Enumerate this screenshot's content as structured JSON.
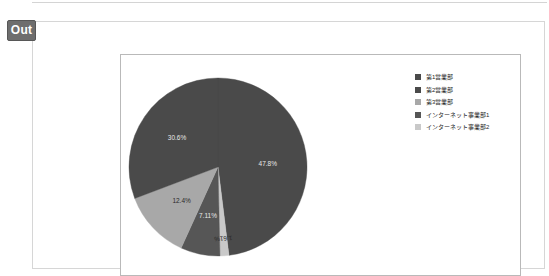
{
  "badge": {
    "label": "Out"
  },
  "chart_data": {
    "type": "pie",
    "title": "",
    "legend_position": "right",
    "categories": [
      "第1営業部",
      "第2営業部",
      "第3営業部",
      "インターネット事業部1",
      "インターネット事業部2"
    ],
    "values": [
      47.8,
      30.6,
      12.4,
      7.11,
      1.61
    ],
    "value_labels": [
      "47.8%",
      "30.6%",
      "12.4%",
      "7.11%",
      "1.61%"
    ],
    "colors": [
      "#4a4a4a",
      "#4a4a4a",
      "#a8a8a8",
      "#565656",
      "#c9c9c9"
    ],
    "slices": [
      {
        "label": "第1営業部",
        "value": 47.8,
        "display": "47.8%",
        "color": "#4a4a4a",
        "label_fill": "on-dark"
      },
      {
        "label": "インターネット事業部2",
        "value": 1.61,
        "display": "1.61%",
        "color": "#c9c9c9",
        "label_fill": "on-light"
      },
      {
        "label": "インターネット事業部1",
        "value": 7.11,
        "display": "7.11%",
        "color": "#565656",
        "label_fill": "on-dark"
      },
      {
        "label": "第3営業部",
        "value": 12.4,
        "display": "12.4%",
        "color": "#a8a8a8",
        "label_fill": "on-light"
      },
      {
        "label": "第2営業部",
        "value": 30.6,
        "display": "30.6%",
        "color": "#4a4a4a",
        "label_fill": "on-dark"
      }
    ]
  },
  "legend": {
    "items": [
      {
        "label": "第1営業部",
        "color": "#4a4a4a"
      },
      {
        "label": "第2営業部",
        "color": "#4a4a4a"
      },
      {
        "label": "第3営業部",
        "color": "#a8a8a8"
      },
      {
        "label": "インターネット事業部1",
        "color": "#565656"
      },
      {
        "label": "インターネット事業部2",
        "color": "#c9c9c9"
      }
    ]
  }
}
